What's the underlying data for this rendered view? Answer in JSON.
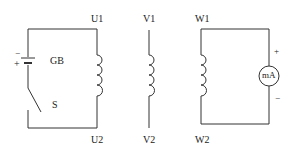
{
  "diagram": {
    "type": "three-phase winding polarity test circuit",
    "windings": [
      {
        "name": "U",
        "start_label": "U1",
        "end_label": "U2"
      },
      {
        "name": "V",
        "start_label": "V1",
        "end_label": "V2"
      },
      {
        "name": "W",
        "start_label": "W1",
        "end_label": "W2"
      }
    ],
    "battery": {
      "label": "GB",
      "plus_sign": "+",
      "minus_sign": "−"
    },
    "switch": {
      "label": "S"
    },
    "meter": {
      "label": "mA",
      "plus_sign": "+",
      "minus_sign": "−"
    }
  }
}
